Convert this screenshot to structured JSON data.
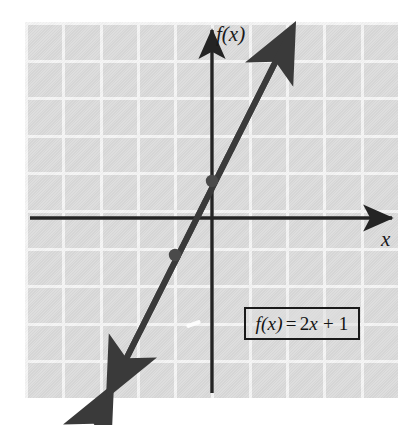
{
  "figure": {
    "background_color": "#ffffff",
    "plot_background_color": "#d9d9d9",
    "gridline_color": "#f4f4f4",
    "ink_color": "#2b2b2b"
  },
  "axes": {
    "y_label": "f(x)",
    "x_label": "x",
    "y_axis_name": "vertical-axis",
    "x_axis_name": "horizontal-axis"
  },
  "equation_box": {
    "prefix_function": "f",
    "full_text": "f(x) = 2x + 1",
    "lhs": "f(x)",
    "equals": "=",
    "rhs": "2x + 1"
  },
  "chart_data": {
    "type": "line",
    "xlabel": "x",
    "ylabel": "f(x)",
    "xlim": [
      -5,
      5
    ],
    "ylim": [
      -5,
      5
    ],
    "grid": true,
    "grid_spacing": 1,
    "legend": "none",
    "series": [
      {
        "name": "f(x) = 2x + 1",
        "equation": "f(x) = 2x + 1",
        "slope": 2,
        "intercept": 1,
        "x": [
          -3,
          2
        ],
        "y": [
          -5,
          5
        ],
        "arrows": "both",
        "color": "#3a3a3a"
      }
    ],
    "points": [
      {
        "label": "y-intercept",
        "x": 0,
        "y": 1
      },
      {
        "label": "second-point",
        "x": -1,
        "y": -1
      }
    ],
    "annotations": [
      {
        "text": "f(x) = 2x + 1",
        "x": 2.1,
        "y": -2.6,
        "boxed": true
      }
    ]
  }
}
